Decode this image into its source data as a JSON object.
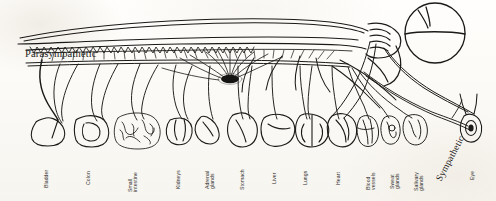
{
  "figure": {
    "style": "hand-drawn ink line art on scanned paper",
    "ink_color": "#1a1a18",
    "paper_color": "#fdfcfa"
  },
  "annotations": {
    "parasympathetic": {
      "label": "Parasympathetic",
      "x": 25,
      "y": 48
    },
    "sympathetic": {
      "label": "Sympathetic",
      "x": 434,
      "y": 178
    }
  },
  "anatomy": {
    "brain": "brain-circle",
    "spinal_cord": "spinal-cord",
    "ganglion": "sympathetic-ganglion-chain"
  },
  "organ_labels": [
    {
      "name": "bladder",
      "lines": [
        "Bladder"
      ],
      "x": 44,
      "y": 188
    },
    {
      "name": "colon",
      "lines": [
        "Colon"
      ],
      "x": 86,
      "y": 185
    },
    {
      "name": "small-intestine",
      "lines": [
        "Small",
        "intestine"
      ],
      "x": 128,
      "y": 192
    },
    {
      "name": "kidneys",
      "lines": [
        "Kidneys"
      ],
      "x": 176,
      "y": 189
    },
    {
      "name": "adrenal-glands",
      "lines": [
        "Adrenal",
        "glands"
      ],
      "x": 205,
      "y": 189
    },
    {
      "name": "stomach",
      "lines": [
        "Stomach"
      ],
      "x": 240,
      "y": 190
    },
    {
      "name": "liver",
      "lines": [
        "Liver"
      ],
      "x": 272,
      "y": 184
    },
    {
      "name": "lungs",
      "lines": [
        "Lungs"
      ],
      "x": 303,
      "y": 185
    },
    {
      "name": "heart",
      "lines": [
        "Heart"
      ],
      "x": 336,
      "y": 185
    },
    {
      "name": "blood-vessels",
      "lines": [
        "Blood",
        "vessels"
      ],
      "x": 366,
      "y": 190
    },
    {
      "name": "sweat-glands",
      "lines": [
        "Sweat",
        "glands"
      ],
      "x": 390,
      "y": 189
    },
    {
      "name": "salivary-glands",
      "lines": [
        "Salivary",
        "glands"
      ],
      "x": 414,
      "y": 191
    },
    {
      "name": "eye",
      "lines": [
        "Eye"
      ],
      "x": 470,
      "y": 180
    }
  ]
}
